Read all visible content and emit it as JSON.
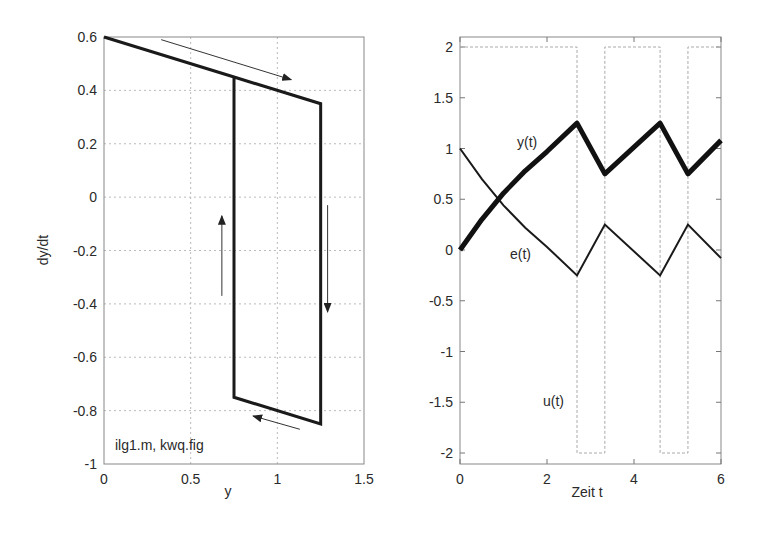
{
  "chart_data": [
    {
      "type": "line",
      "title": "",
      "xlabel": "y",
      "ylabel": "dy/dt",
      "xlim": [
        0,
        1.5
      ],
      "ylim": [
        -1,
        0.6
      ],
      "xticks": [
        0,
        0.5,
        1,
        1.5
      ],
      "xtick_labels": [
        "0",
        "0.5",
        "1",
        "1.5"
      ],
      "yticks": [
        0.6,
        0.4,
        0.2,
        0,
        -0.2,
        -0.4,
        -0.6,
        -0.8,
        -1
      ],
      "ytick_labels": [
        "0.6",
        "0.4",
        "0.2",
        "0",
        "-0.2",
        "-0.4",
        "-0.6",
        "-0.8",
        "-1"
      ],
      "grid": true,
      "annotation": "ilg1.m, kwq.fig",
      "series": [
        {
          "name": "phase trajectory",
          "x": [
            0,
            0.75,
            1.25,
            1.25,
            0.75,
            0.75,
            1.25
          ],
          "y": [
            0.6,
            0.45,
            0.35,
            -0.85,
            -0.75,
            0.45,
            0.35
          ]
        }
      ],
      "arrows": [
        {
          "direction": "right-down",
          "from": [
            0.33,
            0.59
          ],
          "to": [
            1.08,
            0.44
          ]
        },
        {
          "direction": "down",
          "from": [
            1.29,
            -0.03
          ],
          "to": [
            1.29,
            -0.43
          ]
        },
        {
          "direction": "left-up",
          "from": [
            1.13,
            -0.87
          ],
          "to": [
            0.86,
            -0.82
          ]
        },
        {
          "direction": "up",
          "from": [
            0.68,
            -0.37
          ],
          "to": [
            0.68,
            -0.07
          ]
        }
      ]
    },
    {
      "type": "line",
      "title": "",
      "xlabel": "Zeit t",
      "ylabel": "",
      "xlim": [
        0,
        6
      ],
      "ylim": [
        -2.1,
        2.1
      ],
      "xticks": [
        0,
        2,
        4,
        6
      ],
      "xtick_labels": [
        "0",
        "2",
        "4",
        "6"
      ],
      "yticks": [
        2,
        1.5,
        1,
        0.5,
        0,
        -0.5,
        -1,
        -1.5,
        -2
      ],
      "ytick_labels": [
        "2",
        "1.5",
        "1",
        "0.5",
        "0",
        "-0.5",
        "-1",
        "-1.5",
        "-2"
      ],
      "grid": false,
      "series": [
        {
          "name": "y(t)",
          "x": [
            0,
            0.5,
            1,
            1.5,
            2,
            2.69,
            3.33,
            4.6,
            5.24,
            6
          ],
          "y": [
            0,
            0.3,
            0.56,
            0.78,
            0.97,
            1.25,
            0.75,
            1.25,
            0.75,
            1.08
          ]
        },
        {
          "name": "e(t)",
          "x": [
            0,
            0.5,
            1,
            1.5,
            2,
            2.69,
            3.33,
            4.6,
            5.24,
            6
          ],
          "y": [
            1,
            0.7,
            0.44,
            0.22,
            0.03,
            -0.25,
            0.25,
            -0.25,
            0.25,
            -0.08
          ]
        },
        {
          "name": "u(t)",
          "x": [
            0,
            2.69,
            2.69,
            3.33,
            3.33,
            4.6,
            4.6,
            5.24,
            5.24,
            6
          ],
          "y": [
            2,
            2,
            -2,
            -2,
            2,
            2,
            -2,
            -2,
            2,
            2
          ]
        }
      ],
      "labels": {
        "y": "y(t)",
        "e": "e(t)",
        "u": "u(t)"
      }
    }
  ],
  "left": {
    "xlabel": "y",
    "ylabel": "dy/dt",
    "annotation": "ilg1.m, kwq.fig"
  },
  "right": {
    "xlabel": "Zeit t",
    "label_y": "y(t)",
    "label_e": "e(t)",
    "label_u": "u(t)"
  }
}
